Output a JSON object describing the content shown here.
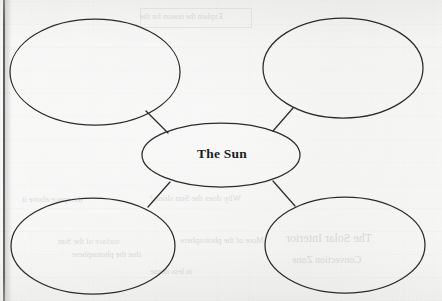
{
  "document": {
    "type": "worksheet-concept-map",
    "background_color": "#f3f3f2",
    "ink_color": "#2b2b2b"
  },
  "diagram": {
    "name": "concept-map",
    "layout": "central-node-with-four-satellites",
    "center_node": {
      "id": "center",
      "label": "The Sun",
      "cx": 221,
      "cy": 155,
      "rx": 79,
      "ry": 32,
      "filled": false
    },
    "satellite_nodes": [
      {
        "id": "top-left",
        "label": "",
        "cx": 95,
        "cy": 72,
        "rx": 85,
        "ry": 53
      },
      {
        "id": "top-right",
        "label": "",
        "cx": 343,
        "cy": 68,
        "rx": 80,
        "ry": 50
      },
      {
        "id": "bottom-left",
        "label": "",
        "cx": 93,
        "cy": 246,
        "rx": 82,
        "ry": 48
      },
      {
        "id": "bottom-right",
        "label": "",
        "cx": 345,
        "cy": 245,
        "rx": 80,
        "ry": 48
      }
    ],
    "connectors": [
      {
        "from": "top-left",
        "to": "center",
        "x1": 146,
        "y1": 111,
        "x2": 168,
        "y2": 133
      },
      {
        "from": "top-right",
        "to": "center",
        "x1": 293,
        "y1": 108,
        "x2": 273,
        "y2": 131
      },
      {
        "from": "bottom-left",
        "to": "center",
        "x1": 148,
        "y1": 207,
        "x2": 170,
        "y2": 182
      },
      {
        "from": "bottom-right",
        "to": "center",
        "x1": 295,
        "y1": 206,
        "x2": 273,
        "y2": 181
      }
    ]
  },
  "page_artifacts": {
    "edge_line": {
      "name": "page-binding-edge",
      "x": 3,
      "width": 2
    },
    "show_through_text": [
      {
        "text": "Explain the reason for the",
        "x": 140,
        "y": 18,
        "size": 8
      },
      {
        "text": "the space above it",
        "x": 22,
        "y": 200,
        "size": 8.5
      },
      {
        "text": "Why does the Sun shine?",
        "x": 150,
        "y": 199,
        "size": 9
      },
      {
        "text": "surface of the Sun",
        "x": 58,
        "y": 242,
        "size": 8.5
      },
      {
        "text": "More of the photosphere",
        "x": 180,
        "y": 241,
        "size": 8.5
      },
      {
        "text": "that the photosphere",
        "x": 72,
        "y": 255,
        "size": 8.5
      },
      {
        "text": "The Solar Interior",
        "x": 286,
        "y": 240,
        "size": 12
      },
      {
        "text": "Convection Zone",
        "x": 292,
        "y": 262,
        "size": 10
      },
      {
        "text": "is less dense",
        "x": 150,
        "y": 272,
        "size": 8.5
      }
    ]
  }
}
